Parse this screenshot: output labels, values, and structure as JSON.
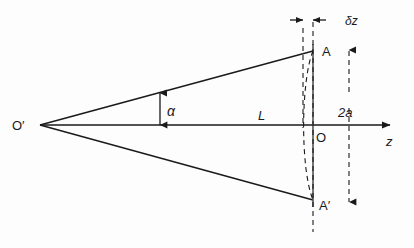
{
  "figure": {
    "type": "optics-ray-diagram",
    "background_color": "#fdfdfd",
    "stroke_color": "#1a1a1a",
    "width": 414,
    "height": 248
  },
  "labels": {
    "source_point": "O′",
    "focus_point": "O",
    "upper_edge_point": "A",
    "lower_edge_point": "A′",
    "half_angle": "α",
    "axial_distance": "L",
    "axis_name": "z",
    "aperture_height": "2a",
    "depth_shift": "δz"
  },
  "geometry": {
    "apex": {
      "x": 40,
      "y": 125
    },
    "origin_O": {
      "x": 313,
      "y": 125
    },
    "upper_point_A": {
      "x": 313,
      "y": 51
    },
    "lower_point_A_prime": {
      "x": 313,
      "y": 200
    },
    "axis_start_x": 40,
    "axis_end_x": 396,
    "screen_line_x": 313,
    "dashed_offset_line_x": 303,
    "aperture_dim_line_x": 349,
    "aperture_dim_top_y": 48,
    "aperture_dim_bottom_y": 204,
    "delta_z_arrow_y": 20,
    "alpha_arrow_x": 160,
    "alpha_arrow_top_y": 94,
    "alpha_arrow_bottom_y": 124
  },
  "label_positions": {
    "source_point": {
      "x": 12,
      "y": 130
    },
    "focus_point": {
      "x": 316,
      "y": 142
    },
    "upper_edge_point": {
      "x": 322,
      "y": 56
    },
    "lower_edge_point": {
      "x": 320,
      "y": 209
    },
    "half_angle": {
      "x": 167,
      "y": 115
    },
    "axial_distance": {
      "x": 258,
      "y": 119
    },
    "axis_name": {
      "x": 389,
      "y": 145
    },
    "aperture_height": {
      "x": 341,
      "y": 116
    },
    "depth_shift": {
      "x": 348,
      "y": 25
    }
  }
}
